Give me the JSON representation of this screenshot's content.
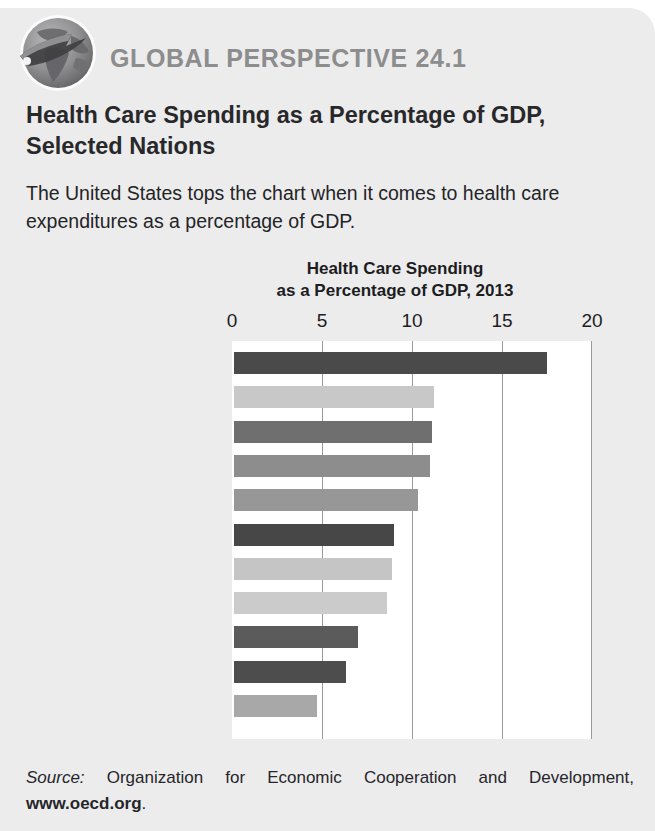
{
  "header": {
    "icon": "globe-icon",
    "kicker": "GLOBAL PERSPECTIVE 24.1",
    "headline": "Health Care Spending as a Percentage of GDP, Selected Nations",
    "blurb": "The United States tops the chart when it comes to health care expenditures as a percentage of GDP."
  },
  "source": {
    "label": "Source:",
    "text": " Organization for Economic Cooperation and Development, ",
    "url": "www.oecd.org",
    "period": "."
  },
  "colors": {
    "panel": "#ececed",
    "kicker": "#8d8d8e",
    "text": "#1d1d1f",
    "plot_background": "#ffffff",
    "gridline": "#9a9a9a"
  },
  "chart_data": {
    "type": "bar",
    "orientation": "horizontal",
    "title": "Health Care Spending as a Percentage of GDP, 2013",
    "title_line1": "Health Care Spending",
    "title_line2": "as a Percentage of GDP, 2013",
    "xlabel": "",
    "ylabel": "",
    "xlim": [
      0,
      20
    ],
    "ticks": [
      0,
      5,
      10,
      15,
      20
    ],
    "tick_labels": [
      "0",
      "5",
      "10",
      "15",
      "20"
    ],
    "grid": true,
    "legend": "none",
    "categories": [
      "United States",
      "Switzerland",
      "Germany",
      "France",
      "Canada",
      "Italy",
      "Australia",
      "United Kingdom",
      "South Korea",
      "Mexico",
      "Singapore"
    ],
    "values": [
      17.4,
      11.1,
      11.0,
      10.9,
      10.2,
      8.9,
      8.8,
      8.5,
      6.9,
      6.2,
      4.6
    ],
    "bar_colors": [
      "#4a4a4a",
      "#c8c8c9",
      "#6f6f70",
      "#8d8d8e",
      "#979798",
      "#474748",
      "#c5c5c6",
      "#cbcbcc",
      "#5b5b5c",
      "#4d4d4e",
      "#a8a8a9"
    ]
  }
}
